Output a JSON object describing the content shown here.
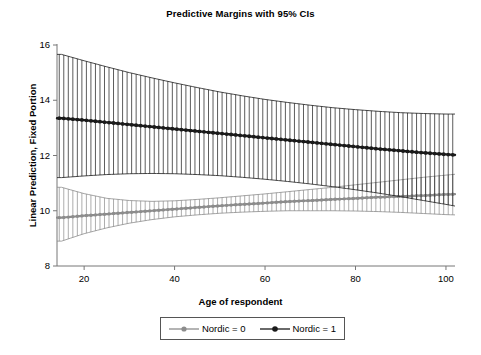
{
  "chart_data": {
    "type": "line",
    "title": "Predictive Margins with 95% CIs",
    "xlabel": "Age of respondent",
    "ylabel": "Linear Prediction, Fixed Portion",
    "xlim": [
      14,
      102
    ],
    "ylim": [
      8,
      16
    ],
    "xticks": [
      20,
      40,
      60,
      80,
      100
    ],
    "yticks": [
      8,
      10,
      12,
      14,
      16
    ],
    "grid": false,
    "legend_position": "bottom",
    "error_bars": "vertical 95% CI at each integer age",
    "series": [
      {
        "name": "Nordic = 0",
        "color": "#8c8c8c",
        "x": [
          15,
          20,
          25,
          30,
          35,
          40,
          45,
          50,
          55,
          60,
          65,
          70,
          75,
          80,
          85,
          90,
          95,
          100,
          102
        ],
        "values": [
          9.75,
          9.82,
          9.88,
          9.94,
          10.0,
          10.06,
          10.12,
          10.18,
          10.23,
          10.28,
          10.33,
          10.37,
          10.41,
          10.45,
          10.49,
          10.52,
          10.55,
          10.59,
          10.6
        ],
        "ci_lower": [
          8.9,
          9.17,
          9.38,
          9.55,
          9.68,
          9.78,
          9.85,
          9.91,
          9.95,
          9.98,
          10.0,
          10.0,
          10.0,
          9.99,
          9.97,
          9.94,
          9.9,
          9.86,
          9.85
        ],
        "ci_upper": [
          10.85,
          10.62,
          10.45,
          10.37,
          10.34,
          10.36,
          10.41,
          10.47,
          10.54,
          10.61,
          10.69,
          10.77,
          10.85,
          10.94,
          11.03,
          11.12,
          11.21,
          11.29,
          11.32
        ]
      },
      {
        "name": "Nordic = 1",
        "color": "#1a1a1a",
        "x": [
          15,
          20,
          25,
          30,
          35,
          40,
          45,
          50,
          55,
          60,
          65,
          70,
          75,
          80,
          85,
          90,
          95,
          100,
          102
        ],
        "values": [
          13.35,
          13.28,
          13.2,
          13.12,
          13.04,
          12.96,
          12.88,
          12.8,
          12.72,
          12.64,
          12.56,
          12.48,
          12.4,
          12.32,
          12.24,
          12.17,
          12.1,
          12.04,
          12.02
        ],
        "ci_lower": [
          11.2,
          11.26,
          11.31,
          11.34,
          11.35,
          11.34,
          11.31,
          11.27,
          11.21,
          11.14,
          11.06,
          10.97,
          10.87,
          10.76,
          10.64,
          10.51,
          10.37,
          10.23,
          10.17
        ],
        "ci_upper": [
          15.66,
          15.43,
          15.21,
          15.0,
          14.81,
          14.63,
          14.46,
          14.3,
          14.16,
          14.03,
          13.92,
          13.82,
          13.73,
          13.66,
          13.6,
          13.55,
          13.52,
          13.5,
          13.5
        ]
      }
    ]
  },
  "legend": {
    "items": [
      {
        "label": "Nordic = 0",
        "color": "#8c8c8c"
      },
      {
        "label": "Nordic = 1",
        "color": "#1a1a1a"
      }
    ]
  }
}
